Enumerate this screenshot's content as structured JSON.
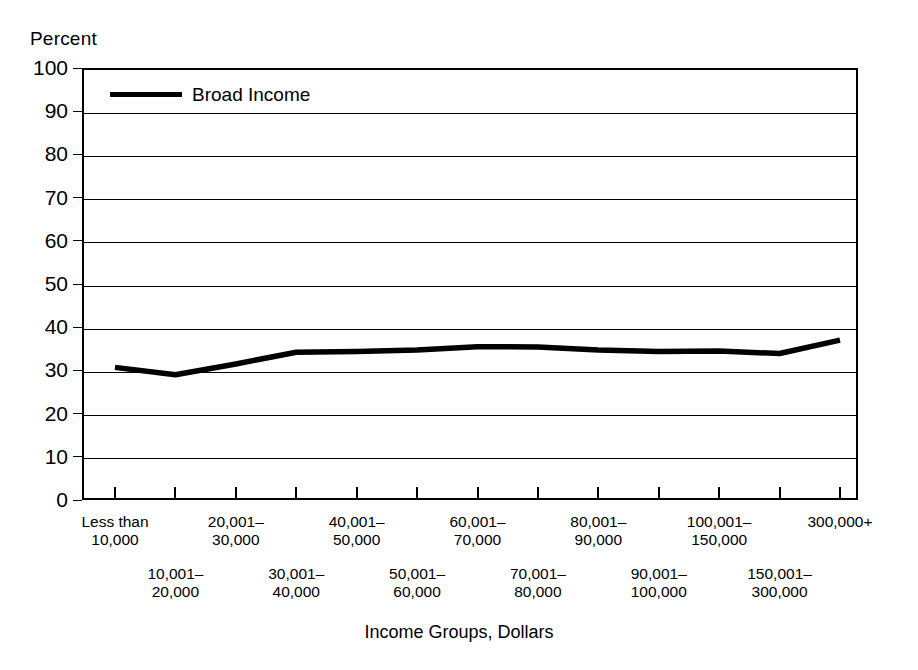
{
  "chart_data": {
    "type": "line",
    "title": "",
    "ylabel": "Percent",
    "xlabel": "Income Groups, Dollars",
    "ylim": [
      0,
      100
    ],
    "ytick_labels": [
      "100",
      "90",
      "80",
      "70",
      "60",
      "50",
      "40",
      "30",
      "20",
      "10",
      "0"
    ],
    "ytick_values": [
      100,
      90,
      80,
      70,
      60,
      50,
      40,
      30,
      20,
      10,
      0
    ],
    "grid": true,
    "legend_position": "top-left",
    "categories": [
      "Less than 10,000",
      "10,001-20,000",
      "20,001-30,000",
      "30,001-40,000",
      "40,001-50,000",
      "50,001-60,000",
      "60,001-70,000",
      "70,001-80,000",
      "80,001-90,000",
      "90,001-100,000",
      "100,001-150,000",
      "150,001-300,000",
      "300,000+"
    ],
    "series": [
      {
        "name": "Broad Income",
        "color": "#000000",
        "values": [
          30.7,
          29.0,
          31.5,
          34.2,
          34.4,
          34.7,
          35.5,
          35.4,
          34.7,
          34.4,
          34.5,
          33.9,
          37.0
        ]
      }
    ]
  },
  "legend": {
    "entries": [
      {
        "label": "Broad Income",
        "color": "#000000"
      }
    ]
  },
  "axes": {
    "y_title": "Percent",
    "x_title": "Income Groups, Dollars"
  },
  "xaxis_labels": [
    {
      "line1": "Less than",
      "line2": "10,000",
      "row": "upper"
    },
    {
      "line1": "10,001–",
      "line2": "20,000",
      "row": "lower"
    },
    {
      "line1": "20,001–",
      "line2": "30,000",
      "row": "upper"
    },
    {
      "line1": "30,001–",
      "line2": "40,000",
      "row": "lower"
    },
    {
      "line1": "40,001–",
      "line2": "50,000",
      "row": "upper"
    },
    {
      "line1": "50,001–",
      "line2": "60,000",
      "row": "lower"
    },
    {
      "line1": "60,001–",
      "line2": "70,000",
      "row": "upper"
    },
    {
      "line1": "70,001–",
      "line2": "80,000",
      "row": "lower"
    },
    {
      "line1": "80,001–",
      "line2": "90,000",
      "row": "upper"
    },
    {
      "line1": "90,001–",
      "line2": "100,000",
      "row": "lower"
    },
    {
      "line1": "100,001–",
      "line2": "150,000",
      "row": "upper"
    },
    {
      "line1": "150,001–",
      "line2": "300,000",
      "row": "lower"
    },
    {
      "line1": "300,000+",
      "line2": "",
      "row": "upper"
    }
  ]
}
